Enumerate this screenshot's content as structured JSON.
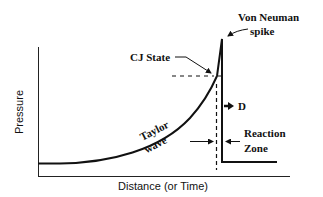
{
  "diagram": {
    "type": "detonation pressure profile",
    "axes": {
      "x_label": "Distance (or Time)",
      "y_label": "Pressure"
    },
    "annotations": {
      "von_neuman_line1": "Von Neuman",
      "von_neuman_line2": "spike",
      "cj_state": "CJ State",
      "detonation_velocity": "D",
      "reaction_zone_line1": "Reaction",
      "reaction_zone_line2": "Zone",
      "taylor_line1": "Taylor",
      "taylor_line2": "wave"
    },
    "colors": {
      "line": "#111111",
      "background": "#ffffff"
    }
  }
}
